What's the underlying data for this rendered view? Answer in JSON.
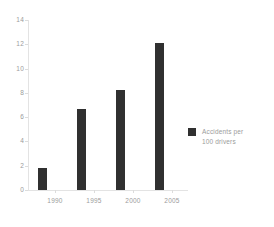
{
  "chart_data": {
    "type": "bar",
    "title": "",
    "subtitle": "",
    "xlabel": "",
    "ylabel": "",
    "categories": [
      "1990",
      "1995",
      "2000",
      "2005"
    ],
    "values": [
      1.8,
      6.7,
      8.2,
      12.1
    ],
    "series": [
      {
        "name": "Accidents per 100 drivers",
        "values": [
          1.8,
          6.7,
          8.2,
          12.1
        ]
      }
    ],
    "ylim": [
      0,
      14
    ],
    "xlim": [
      "1988",
      "2007"
    ],
    "y_ticks": [
      0,
      2,
      4,
      6,
      8,
      10,
      12,
      14
    ],
    "y_tick_labels": [
      "0",
      "2",
      "4",
      "6",
      "8",
      "10",
      "12",
      "14"
    ],
    "x_tick_labels": [
      "1990",
      "1995",
      "2000",
      "2005"
    ],
    "grid": false,
    "legend_position": "right",
    "legend_entries": [
      "Accidents per\n100 drivers"
    ],
    "bar_color": "#303030",
    "axis_color": "#e3e3e3",
    "tick_label_color": "#9b9b9b",
    "background_color": "#ffffff"
  },
  "legend": {
    "label": "Accidents per\n100 drivers",
    "swatch_color": "#303030"
  }
}
